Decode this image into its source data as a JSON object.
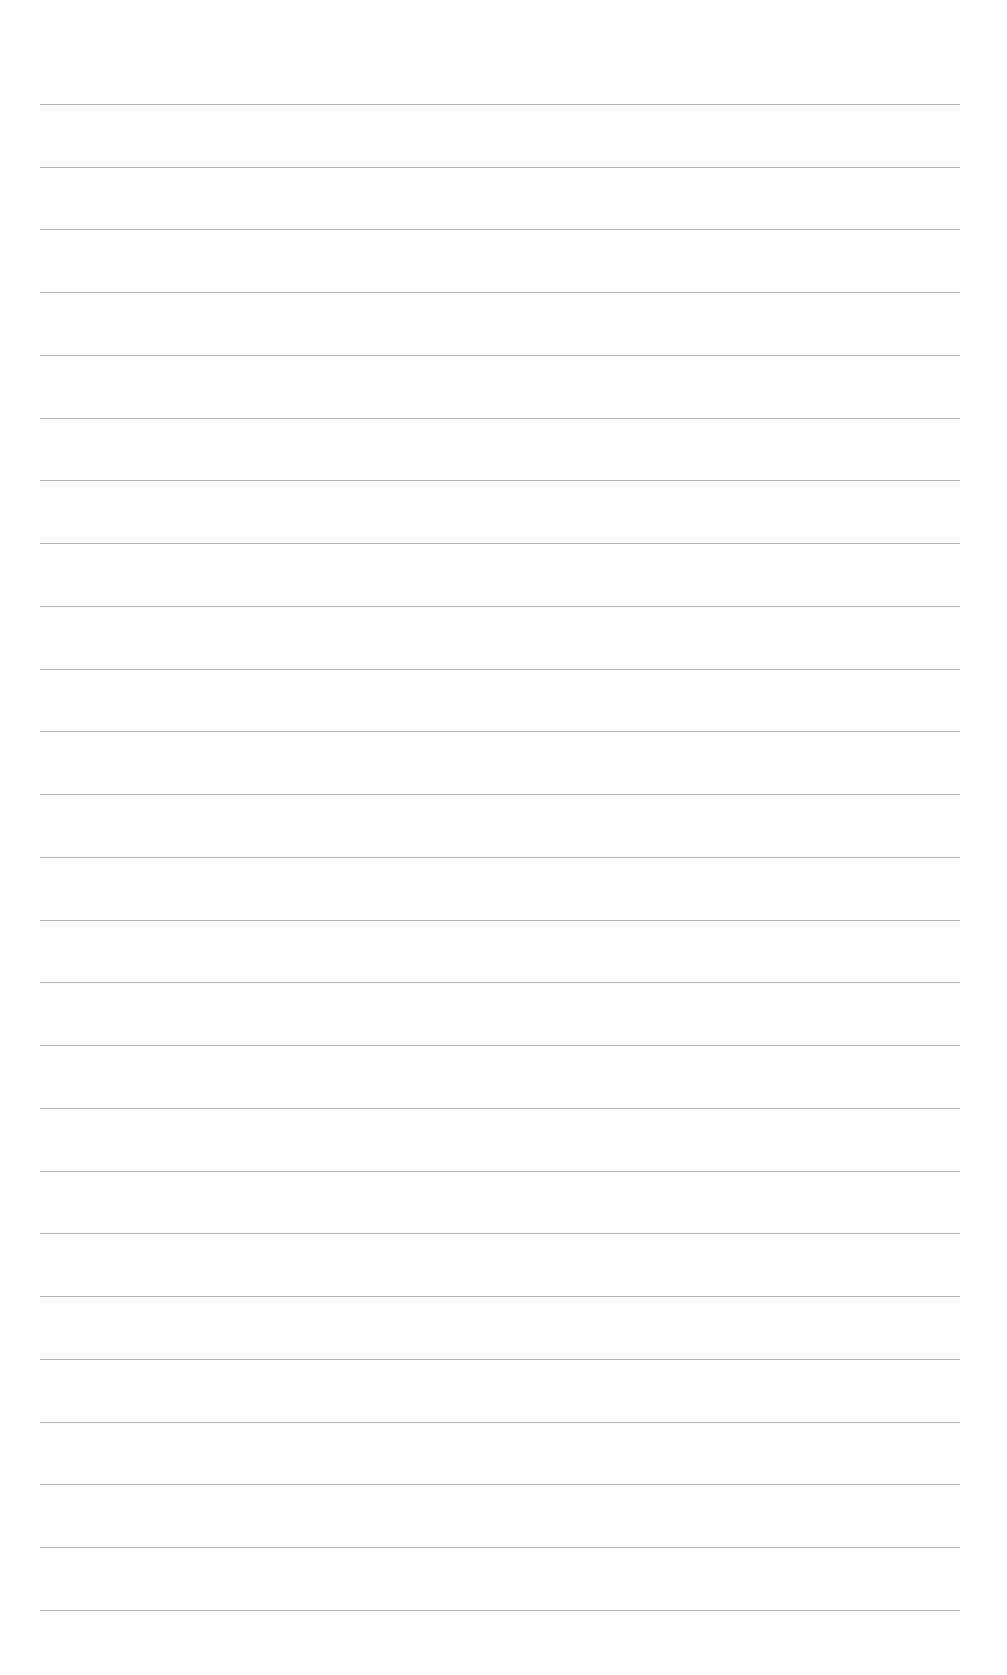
{
  "document": {
    "type": "lined-paper",
    "content": "",
    "rule_color": "#9a9a9a",
    "background_color": "#fefefe",
    "rule_count": 25,
    "rules_y": [
      104,
      167,
      229,
      292,
      355,
      418,
      480,
      543,
      606,
      669,
      731,
      794,
      857,
      920,
      982,
      1045,
      1108,
      1171,
      1233,
      1296,
      1359,
      1422,
      1484,
      1547,
      1610
    ]
  }
}
